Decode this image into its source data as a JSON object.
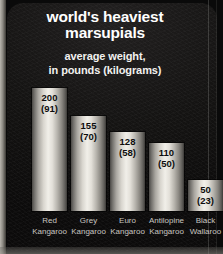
{
  "chart_data": {
    "type": "bar",
    "title": "world's heaviest marsupials",
    "title_line1": "world's heaviest",
    "title_line2": "marsupials",
    "subtitle": "average weight, in pounds (kilograms)",
    "subtitle_line1": "average weight,",
    "subtitle_line2": "in pounds (kilograms)",
    "xlabel": "",
    "ylabel": "average weight in pounds (kilograms)",
    "units_primary": "pounds",
    "units_secondary": "kilograms",
    "ylim": [
      0,
      200
    ],
    "grid": false,
    "legend": "none",
    "categories": [
      "Red Kangaroo",
      "Grey Kangaroo",
      "Euro Kangaroo",
      "Antilopine Kangaroo",
      "Black Wallaroo"
    ],
    "values": [
      200,
      155,
      128,
      110,
      50
    ],
    "values_kg": [
      91,
      70,
      58,
      50,
      23
    ],
    "bars": [
      {
        "name": "Red Kangaroo",
        "line1": "Red",
        "line2": "Kangaroo",
        "lb": 200,
        "kg": 91,
        "label_lb": "200",
        "label_kg": "(91)"
      },
      {
        "name": "Grey Kangaroo",
        "line1": "Grey",
        "line2": "Kangaroo",
        "lb": 155,
        "kg": 70,
        "label_lb": "155",
        "label_kg": "(70)"
      },
      {
        "name": "Euro Kangaroo",
        "line1": "Euro",
        "line2": "Kangaroo",
        "lb": 128,
        "kg": 58,
        "label_lb": "128",
        "label_kg": "(58)"
      },
      {
        "name": "Antilopine Kangaroo",
        "line1": "Antilopine",
        "line2": "Kangaroo",
        "lb": 110,
        "kg": 50,
        "label_lb": "110",
        "label_kg": "(50)"
      },
      {
        "name": "Black Wallaroo",
        "line1": "Black",
        "line2": "Wallaroo",
        "lb": 50,
        "kg": 23,
        "label_lb": "50",
        "label_kg": "(23)"
      }
    ],
    "colors": {
      "background": "#0c0b0b",
      "title_text": "#ffffff",
      "subtitle_text": "#f2f1ef",
      "category_text": "#c9c6c0",
      "value_text": "#0d0d0d",
      "bar_highlight": "#f1efe9",
      "bar_shadow": "#3c3a37",
      "edge_strip": "#b9b6ae"
    }
  }
}
